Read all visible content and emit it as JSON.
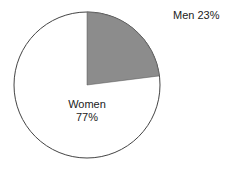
{
  "chart_data": {
    "type": "pie",
    "title": "",
    "categories": [
      "Men",
      "Women"
    ],
    "values": [
      23,
      77
    ],
    "labels": [
      "Men 23%",
      "Women 77%"
    ],
    "colors": [
      "#8a8a8a",
      "#ffffff"
    ],
    "legend": "none"
  },
  "labels": {
    "men": "Men 23%",
    "women_name": "Women",
    "women_pct": "77%"
  }
}
